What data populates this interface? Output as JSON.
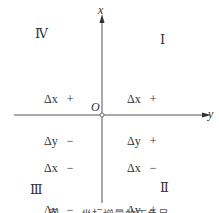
{
  "axes": {
    "vertical_label": "x",
    "horizontal_label": "y",
    "origin_label": "O"
  },
  "quadrants": [
    {
      "name": "I",
      "roman": "Ⅰ",
      "dx": "+",
      "dy": "+"
    },
    {
      "name": "II",
      "roman": "Ⅱ",
      "dx": "−",
      "dy": "+"
    },
    {
      "name": "III",
      "roman": "Ⅲ",
      "dx": "−",
      "dy": "−"
    },
    {
      "name": "IV",
      "roman": "Ⅳ",
      "dx": "+",
      "dy": "−"
    }
  ],
  "symbols": {
    "dx": "Δx",
    "dy": "Δy"
  },
  "caption": "图 · · · 坐标增量的正负号"
}
